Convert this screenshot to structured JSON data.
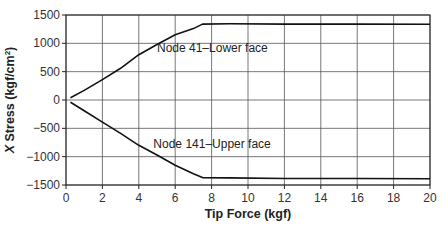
{
  "chart_data": {
    "type": "line",
    "title": "",
    "xlabel": "Tip Force (kgf)",
    "ylabel_prefix": "X",
    "ylabel_rest": " Stress (kgf/cm",
    "ylabel_sup": "2",
    "ylabel_close": ")",
    "ylabel": "X Stress (kgf/cm²)",
    "xlim": [
      0,
      20
    ],
    "ylim": [
      -1500,
      1500
    ],
    "xticks": [
      0,
      2,
      4,
      6,
      8,
      10,
      12,
      14,
      16,
      18,
      20
    ],
    "yticks": [
      1500,
      1000,
      500,
      0,
      -500,
      -1000,
      -1500
    ],
    "ytick_labels": [
      "1500",
      "1000",
      "500",
      "0",
      "−500",
      "−1000",
      "−1500"
    ],
    "grid": true,
    "legend": "none (inline annotations)",
    "series": [
      {
        "name": "Node 41–Lower face",
        "x": [
          0.25,
          1,
          2,
          3,
          4,
          5,
          6,
          7,
          7.5,
          9,
          12,
          16,
          20
        ],
        "y": [
          40,
          170,
          360,
          560,
          800,
          980,
          1150,
          1260,
          1340,
          1345,
          1340,
          1340,
          1335
        ]
      },
      {
        "name": "Node 141–Upper face",
        "x": [
          0.25,
          1,
          2,
          3,
          4,
          5,
          6,
          7,
          7.5,
          9,
          12,
          16,
          20
        ],
        "y": [
          -40,
          -190,
          -390,
          -590,
          -800,
          -970,
          -1150,
          -1300,
          -1370,
          -1375,
          -1385,
          -1385,
          -1390
        ]
      }
    ],
    "annotations": [
      {
        "text": "Node 41–Lower face",
        "x": 5.0,
        "y": 920
      },
      {
        "text": "Node 141–Upper face",
        "x": 4.8,
        "y": -770
      }
    ]
  }
}
